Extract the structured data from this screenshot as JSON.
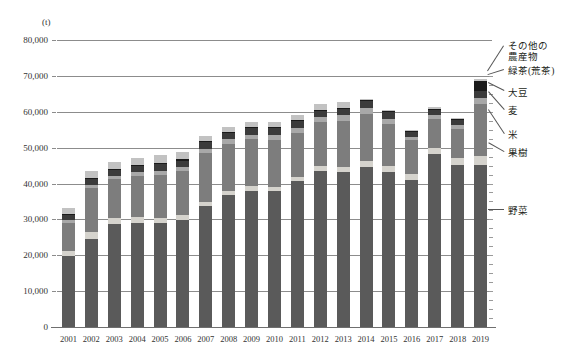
{
  "chart_data": {
    "type": "bar",
    "stacked": true,
    "title": "",
    "subtitle": "",
    "xlabel": "",
    "ylabel": "",
    "unit_label": "(t)",
    "ylim": [
      0,
      80000
    ],
    "ytick_step": 10000,
    "ytick_labels": [
      "0",
      "10,000",
      "20,000",
      "30,000",
      "40,000",
      "50,000",
      "60,000",
      "70,000",
      "80,000"
    ],
    "ytick_values": [
      0,
      10000,
      20000,
      30000,
      40000,
      50000,
      60000,
      70000,
      80000
    ],
    "grid": true,
    "legend_position": "right-callout",
    "categories": [
      "2001",
      "2002",
      "2003",
      "2004",
      "2005",
      "2006",
      "2007",
      "2008",
      "2009",
      "2010",
      "2011",
      "2012",
      "2013",
      "2014",
      "2015",
      "2016",
      "2017",
      "2018",
      "2019"
    ],
    "series": [
      {
        "name": "野菜",
        "color": "#5a5a5a",
        "values": [
          19800,
          24500,
          28700,
          29100,
          29000,
          29700,
          33600,
          36700,
          37900,
          37800,
          40600,
          43400,
          43100,
          44700,
          43200,
          41000,
          48100,
          45200,
          45100
        ]
      },
      {
        "name": "果樹",
        "color": "#d5d3cd",
        "values": [
          1500,
          1900,
          1600,
          1500,
          1400,
          1500,
          1200,
          1100,
          1300,
          1300,
          1300,
          1500,
          1600,
          1500,
          1600,
          1700,
          1800,
          1900,
          2500
        ]
      },
      {
        "name": "米",
        "color": "#7d7d7d",
        "values": [
          7700,
          12400,
          10900,
          11500,
          12000,
          12200,
          13600,
          13200,
          13200,
          13100,
          12100,
          12300,
          12800,
          13200,
          11900,
          9300,
          8000,
          8000,
          14700
        ]
      },
      {
        "name": "麦",
        "color": "#a8a8a8",
        "values": [
          900,
          900,
          1000,
          1100,
          1200,
          1200,
          1300,
          1300,
          1200,
          1300,
          1500,
          1400,
          1500,
          1600,
          1400,
          1100,
          1300,
          1300,
          1400
        ]
      },
      {
        "name": "大豆",
        "color": "#3b3b3b",
        "values": [
          1400,
          1500,
          1600,
          1700,
          1800,
          1800,
          1800,
          1700,
          1800,
          2000,
          1800,
          1700,
          1800,
          1900,
          1700,
          1200,
          1200,
          1200,
          2100
        ]
      },
      {
        "name": "緑茶(荒茶)",
        "color": "#1a1a1a",
        "values": [
          300,
          300,
          300,
          300,
          300,
          300,
          300,
          300,
          300,
          300,
          300,
          300,
          300,
          300,
          300,
          300,
          300,
          300,
          2900
        ]
      },
      {
        "name": "その他の農産物",
        "color": "#c2c2c2",
        "values": [
          1700,
          2100,
          2000,
          2000,
          2200,
          2100,
          1500,
          1500,
          1500,
          1400,
          1600,
          1500,
          1500,
          500,
          400,
          400,
          500,
          400,
          300
        ]
      }
    ],
    "totals": [
      33300,
      43600,
      46100,
      47200,
      47900,
      48800,
      53300,
      55800,
      57200,
      57200,
      59200,
      62100,
      62600,
      63700,
      60500,
      55000,
      61200,
      58300,
      69000
    ],
    "annotations": []
  },
  "legend": {
    "items": [
      {
        "label": "その他の農産物",
        "key": "other"
      },
      {
        "label": "緑茶(荒茶)",
        "key": "green-tea"
      },
      {
        "label": "大豆",
        "key": "soybean"
      },
      {
        "label": "麦",
        "key": "wheat"
      },
      {
        "label": "米",
        "key": "rice"
      },
      {
        "label": "果樹",
        "key": "fruit"
      },
      {
        "label": "野菜",
        "key": "vegetable"
      }
    ],
    "other_line1": "その他の",
    "other_line2": "農産物"
  }
}
